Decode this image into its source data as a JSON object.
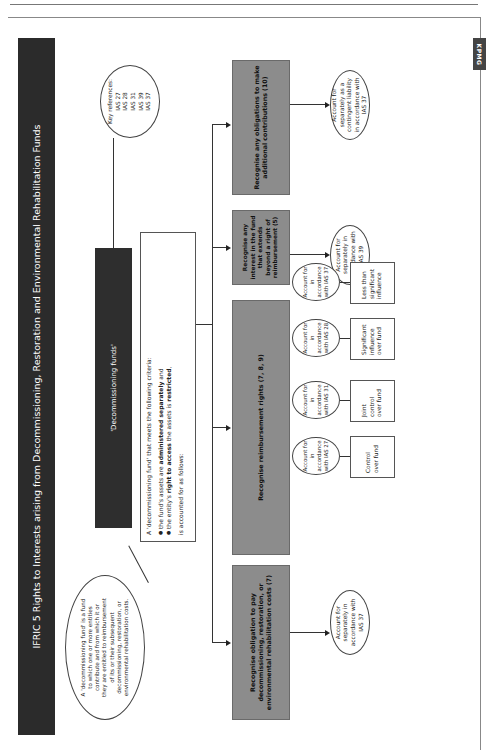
{
  "page": {
    "logo": "KPMG"
  },
  "diagram": {
    "title": "IFRIC 5 Rights to Interests arising from Decommissioning, Restoration and Environmental Rehabilitation Funds",
    "key_references": {
      "label": "Key references:",
      "items": [
        "IAS 27",
        "IAS 28",
        "IAS 31",
        "IAS 39",
        "IAS 37"
      ]
    },
    "header_box": "'Decommissioning funds'",
    "definition_circle": "A 'decommissioning fund' is a fund to which one or more entities contribute and from which it or they are entitled to reimbursement of its or their subsequent decommissioning, restoration, or environmental rehabilitation costs.",
    "criteria": {
      "intro": "A 'decommissioning fund' that meets the following criteria:",
      "item1_pre": "the fund's assets are ",
      "item1_bold": "administered separately",
      "item1_post": " and",
      "item2_pre": "the entity's ",
      "item2_bold": "right to access",
      "item2_post": " the assets is ",
      "item2_bold2": "restricted",
      "item2_end": ",",
      "outro": "is accounted for as follows:"
    },
    "branches": [
      {
        "label": "Recognise obligation to pay decommissioning, restoration, or environmental rehabilitation costs (7)",
        "outcome": "Account for separately in accordance with IAS 37"
      },
      {
        "label": "Recognise reimbursement rights (7, 8, 9)",
        "sub_items": [
          {
            "condition": "Control over fund",
            "outcome": "Account for in accordance with IAS 27"
          },
          {
            "condition": "Joint control over fund",
            "outcome": "Account for in accordance with IAS 31"
          },
          {
            "condition": "Significant influence over fund",
            "outcome": "Account for in accordance with IAS 28"
          },
          {
            "condition": "Less than significant influence",
            "outcome": "Account for in accordance with IAS 37"
          }
        ]
      },
      {
        "label": "Recognise any interest in the fund that extends beyond a right of reimbursement (5)",
        "outcome": "Account for separately in accordance with IAS 39"
      },
      {
        "label": "Recognise any obligations to make additional contributions (10)",
        "outcome": "Account for separately as a contingent liability in accordance with IAS 37"
      }
    ]
  }
}
